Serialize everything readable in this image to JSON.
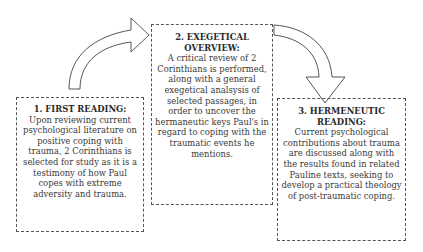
{
  "diagram": {
    "steps": [
      {
        "title": "1. FIRST READING:",
        "body": "Upon reviewing current psychological literature on positive coping with trauma, 2 Corinthians is selected for study as it is a testimony of how Paul copes with extreme adversity and trauma."
      },
      {
        "title": "2. EXEGETICAL OVERVIEW:",
        "body": "A critical review of 2 Corinthians is performed, along with a general exegetical analsysis of selected passages, in order to uncover the hermaneutic keys Paul's in regard to coping with the traumatic events he mentions."
      },
      {
        "title": "3. HERMENEUTIC READING:",
        "body": "Current psychological contributions about trauma are discussed along with the results found in related Pauline texts, seeking to develop a practical theology of post-traumatic coping."
      }
    ],
    "arrows": [
      {
        "from": "step-1",
        "to": "step-2",
        "shape": "curved-up-right"
      },
      {
        "from": "step-2",
        "to": "step-3",
        "shape": "curved-right-down"
      }
    ],
    "colors": {
      "border": "#555555",
      "text": "#3a3a3a",
      "arrow_fill": "#ffffff",
      "arrow_stroke": "#444444"
    }
  }
}
